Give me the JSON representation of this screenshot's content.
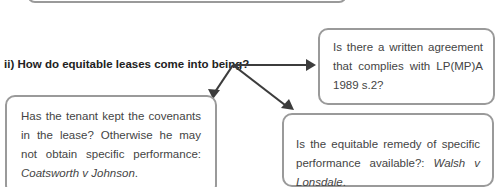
{
  "question": {
    "label": "ii) How do equitable leases come into being?"
  },
  "boxes": {
    "written": {
      "text": "Is there a written agreement that complies with LP(MP)A 1989 s.2?"
    },
    "covenants": {
      "text": "Has the tenant kept the covenants in the lease? Otherwise he may not obtain specific performance: ",
      "case": "Coatsworth v Johnson",
      "end": "."
    },
    "remedy": {
      "text": "Is the equitable remedy of specific performance available?: ",
      "case": "Walsh v Lonsdale",
      "end": "."
    }
  },
  "colors": {
    "arrow": "#3c3c3c",
    "border": "#9a9a9a"
  }
}
